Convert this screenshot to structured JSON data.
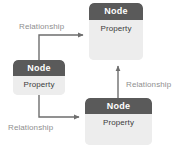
{
  "diagram": {
    "canvas": {
      "width": 184,
      "height": 148,
      "background": "#ffffff"
    },
    "palette": {
      "header_fill": "#5a5a5a",
      "header_text": "#ffffff",
      "body_fill": "#ededed",
      "body_text": "#3c3c3c",
      "edge_stroke": "#6e6e6e",
      "label_text": "#8f8f8f"
    },
    "nodes": [
      {
        "id": "node-top",
        "header": "Node",
        "property": "Property",
        "position": {
          "x": 89,
          "y": 3,
          "width": 54,
          "height": 57
        }
      },
      {
        "id": "node-left",
        "header": "Node",
        "property": "Property",
        "position": {
          "x": 13,
          "y": 60,
          "width": 52,
          "height": 35
        }
      },
      {
        "id": "node-bottom",
        "header": "Node",
        "property": "Property",
        "position": {
          "x": 85,
          "y": 98,
          "width": 67,
          "height": 47
        }
      }
    ],
    "edges": [
      {
        "id": "edge-left-to-top",
        "label": "Relationship",
        "from": "node-left",
        "to": "node-top",
        "label_position": {
          "x": 19,
          "y": 22
        }
      },
      {
        "id": "edge-left-to-bottom",
        "label": "Relationship",
        "from": "node-left",
        "to": "node-bottom",
        "label_position": {
          "x": 8,
          "y": 123
        }
      },
      {
        "id": "edge-bottom-to-top",
        "label": "Relationship",
        "from": "node-bottom",
        "to": "node-top",
        "label_position": {
          "x": 126,
          "y": 80
        }
      }
    ]
  }
}
